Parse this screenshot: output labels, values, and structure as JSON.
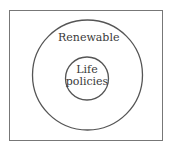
{
  "diagram": {
    "type": "venn-nested",
    "outer_set": {
      "label": "Renewable"
    },
    "inner_set": {
      "label_line1": "Life",
      "label_line2": "policies"
    },
    "colors": {
      "stroke": "#555555",
      "background": "#ffffff",
      "text": "#3a3a3a"
    }
  }
}
